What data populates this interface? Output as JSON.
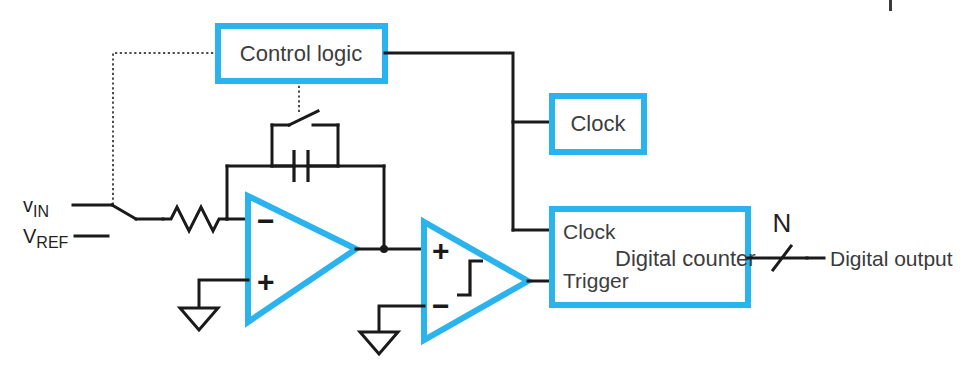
{
  "figure": {
    "accent_color": "#2BB3EE",
    "wire_color": "#1a1a1a",
    "text_color": "#3a3a3a",
    "background": "#ffffff"
  },
  "blocks": {
    "control_logic": {
      "label": "Control logic"
    },
    "clock": {
      "label": "Clock"
    },
    "digital_counter": {
      "label": "Digital counter",
      "pin_clock": "Clock",
      "pin_trigger": "Trigger"
    }
  },
  "amplifiers": {
    "integrator": {
      "name": "integrator-opamp",
      "inverting_input": "−",
      "noninverting_input": "+"
    },
    "comparator": {
      "name": "comparator-schmitt",
      "noninverting_input": "+",
      "inverting_input": "−",
      "symbol": "hysteresis"
    }
  },
  "signals": {
    "v_in_prefix": "v",
    "v_in_sub": "IN",
    "v_ref_prefix": "V",
    "v_ref_sub": "REF",
    "bus_width": "N",
    "output_label": "Digital output"
  },
  "passives": {
    "resistor": "R",
    "capacitor": "C",
    "reset_switch": "reset-switch",
    "input_switch": "input-select-switch"
  },
  "grounds": {
    "integrator_ground": "ground",
    "comparator_ground": "ground"
  }
}
